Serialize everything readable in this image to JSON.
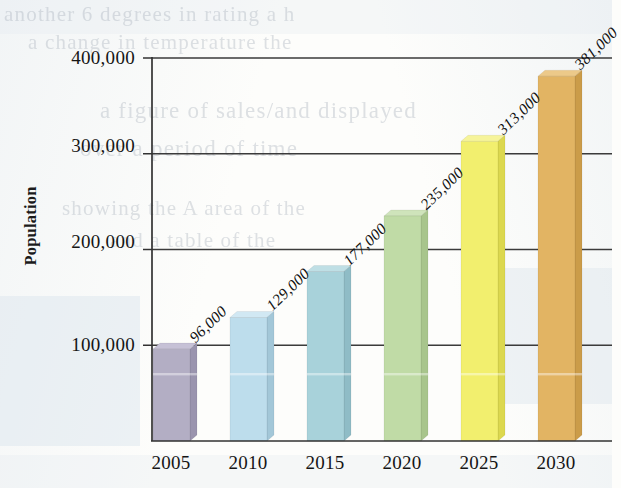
{
  "chart_data": {
    "type": "bar",
    "title": "",
    "subtitle": "",
    "xlabel": "",
    "ylabel": "Population",
    "categories": [
      "2005",
      "2010",
      "2015",
      "2020",
      "2025",
      "2030"
    ],
    "values": [
      96000,
      129000,
      177000,
      235000,
      313000,
      381000
    ],
    "data_labels": [
      "96,000",
      "129,000",
      "177,000",
      "235,000",
      "313,000",
      "381,000"
    ],
    "ylim": [
      0,
      400000
    ],
    "y_ticks": [
      100000,
      200000,
      300000,
      400000
    ],
    "y_tick_labels": [
      "100,000",
      "200,000",
      "300,000",
      "400,000"
    ],
    "grid": true,
    "legend": false,
    "legend_position": "none",
    "bar_colors": [
      "#b3aec4",
      "#bdddec",
      "#a8d2da",
      "#c0dba6",
      "#f2ef6e",
      "#e2b464"
    ],
    "bar_side_colors": [
      "#9a94ae",
      "#a3c7d8",
      "#8fbcc6",
      "#a8c58c",
      "#dcd84f",
      "#cb9c4a"
    ],
    "bar_top_colors": [
      "#c6c1d6",
      "#d1e8f3",
      "#bfdfe5",
      "#cfe4bb",
      "#f6f49a",
      "#ecc989"
    ],
    "annotations": []
  },
  "axis": {
    "y_title": "Population",
    "tick_400k": "400,000",
    "tick_300k": "300,000",
    "tick_200k": "200,000",
    "tick_100k": "100,000"
  },
  "x_labels": {
    "c0": "2005",
    "c1": "2010",
    "c2": "2015",
    "c3": "2020",
    "c4": "2025",
    "c5": "2030"
  },
  "bar_labels": {
    "b0": "96,000",
    "b1": "129,000",
    "b2": "177,000",
    "b3": "235,000",
    "b4": "313,000",
    "b5": "381,000"
  },
  "page_bleed": {
    "line1": "another 6 degrees in rating a h",
    "line2": "a change in temperature the",
    "line3": "a figure of sales/and displayed",
    "line4": "over a period of time",
    "line5": "showing the A area of the",
    "line6": "and a table of the"
  },
  "colors": {
    "axis_line": "#333333",
    "grid_line": "#3a3a3a",
    "text": "#151515",
    "paper": "#fdfdfb"
  }
}
